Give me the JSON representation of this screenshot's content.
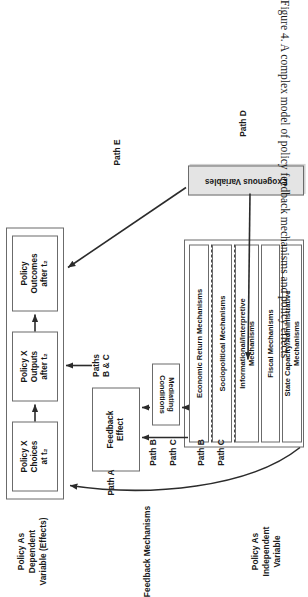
{
  "figure": {
    "caption": "Figure 4. A complex model of policy feedback mechanisms and policy effects"
  },
  "bands": [
    {
      "id": "dependent",
      "label": "Policy As\nDependent\nVariable (Effects)"
    },
    {
      "id": "feedback",
      "label": "Feedback Mechanisms"
    },
    {
      "id": "independent",
      "label": "Policy As\nIndependent\nVariable"
    }
  ],
  "dependent_panel": {
    "nodes": [
      {
        "name": "policy-choices-t2",
        "label": "Policy X\nChoices\nat t₂"
      },
      {
        "name": "policy-outputs-t2",
        "label": "Policy X\nOutputs\nafter t₂"
      },
      {
        "name": "policy-outcomes-t2",
        "label": "Policy\nOutcomes\nafter t₂"
      }
    ]
  },
  "independent_panel": {
    "nodes": [
      {
        "name": "policy-choices-t1",
        "label": "Policy X\nChoices\nat t₁"
      },
      {
        "name": "policy-outputs-t1",
        "label": "Policy X\nOutputs\nafter t₁"
      },
      {
        "name": "direct-policy-outcomes",
        "label": "Direct\nPolicy\nOutcomes"
      }
    ]
  },
  "feedback_effect": {
    "name": "feedback-effect",
    "label": "Feedback\nEffect"
  },
  "mediating_conditions": [
    {
      "name": "mediating-conditions-upper",
      "label": "Mediating\nConditions"
    },
    {
      "name": "mediating-conditions-lower",
      "label": "Mediating\nConditions"
    }
  ],
  "mechanisms_panel": {
    "items": [
      {
        "name": "economic-return-mechanisms",
        "label": "Economic Return Mechanisms"
      },
      {
        "name": "sociopolitical-mechanisms",
        "label": "Sociopolitical Mechanisms"
      },
      {
        "name": "informational-interpretive-mechanisms",
        "label": "Informational/Interpretive\nMechanisms"
      },
      {
        "name": "fiscal-mechanisms",
        "label": "Fiscal Mechanisms"
      },
      {
        "name": "state-capacity-administrative-mechanisms",
        "label": "State Capacity/Administrative\nMechanisms"
      }
    ]
  },
  "exogenous": {
    "name": "exogenous-variables",
    "label": "Exogenous Variables",
    "fill": "#e4e4e4"
  },
  "paths": [
    {
      "name": "path-a",
      "label": "Path A"
    },
    {
      "name": "path-b-upper",
      "label": "Path B"
    },
    {
      "name": "path-c-upper",
      "label": "Path C"
    },
    {
      "name": "path-b-lower",
      "label": "Path B"
    },
    {
      "name": "path-c-lower",
      "label": "Path C"
    },
    {
      "name": "paths-b-and-c",
      "label": "Paths\nB & C"
    },
    {
      "name": "path-d",
      "label": "Path D"
    },
    {
      "name": "path-e",
      "label": "Path E"
    }
  ],
  "colors": {
    "line": "#2b2b2b",
    "border": "#6b6b6b",
    "exogenous_fill": "#e4e4e4"
  }
}
